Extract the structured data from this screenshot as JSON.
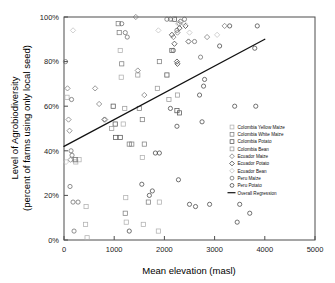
{
  "chart_data": {
    "type": "scatter",
    "title": "",
    "xlabel": "Mean elevation (masl)",
    "ylabel_line1": "Level of Agrobiodiversity",
    "ylabel_line2": "(percent of farms using only local seed)",
    "xlim": [
      0,
      5000
    ],
    "ylim": [
      0,
      100
    ],
    "xticks": [
      0,
      1000,
      2000,
      3000,
      4000,
      5000
    ],
    "xticklabels": [
      "0",
      "1000",
      "2000",
      "3000",
      "4000",
      "5000"
    ],
    "yticks": [
      0,
      20,
      40,
      60,
      80,
      100
    ],
    "yticklabels": [
      "0%",
      "20%",
      "40%",
      "60%",
      "80%",
      "100%"
    ],
    "grid": false,
    "legend_position": "right-middle",
    "regression": {
      "name": "Overall Regression",
      "x_start": 0,
      "y_start": 42,
      "x_end": 4000,
      "y_end": 90,
      "color": "#111111"
    },
    "series": [
      {
        "name": "Colombia Yellow Maize",
        "marker": "square",
        "color": "#b0b0b0",
        "points": [
          [
            60,
            64
          ],
          [
            210,
            36
          ],
          [
            235,
            35
          ],
          [
            300,
            36
          ],
          [
            430,
            7
          ],
          [
            460,
            1
          ],
          [
            440,
            15
          ],
          [
            1140,
            73
          ],
          [
            1120,
            85
          ],
          [
            1180,
            52
          ],
          [
            1230,
            19
          ],
          [
            1240,
            8
          ],
          [
            1560,
            37
          ],
          [
            1580,
            7
          ],
          [
            1880,
            4
          ],
          [
            1900,
            17
          ]
        ]
      },
      {
        "name": "Colombia White Maize",
        "marker": "square",
        "color": "#808080",
        "points": [
          [
            230,
            36
          ],
          [
            1100,
            93
          ],
          [
            1080,
            97
          ],
          [
            1150,
            79
          ],
          [
            1220,
            12
          ],
          [
            1300,
            43
          ],
          [
            1350,
            43
          ],
          [
            1500,
            59
          ],
          [
            1560,
            54
          ],
          [
            1600,
            43
          ],
          [
            1680,
            17
          ],
          [
            1900,
            80
          ]
        ]
      },
      {
        "name": "Colombia Potato",
        "marker": "square",
        "color": "#555555",
        "points": [
          [
            980,
            60
          ],
          [
            1020,
            52
          ],
          [
            1030,
            46
          ],
          [
            1120,
            46
          ],
          [
            2150,
            85
          ],
          [
            2200,
            99
          ],
          [
            2250,
            58
          ],
          [
            2300,
            57
          ],
          [
            2050,
            74
          ]
        ]
      },
      {
        "name": "Colombia Bean",
        "marker": "square",
        "color": "#9a9a9a",
        "points": [
          [
            950,
            50
          ],
          [
            1210,
            59
          ],
          [
            1470,
            74
          ],
          [
            1860,
            68
          ],
          [
            2090,
            63
          ],
          [
            2260,
            65
          ]
        ]
      },
      {
        "name": "Ecuador Maize",
        "marker": "diamond",
        "color": "#777777",
        "points": [
          [
            70,
            68
          ],
          [
            90,
            54
          ],
          [
            110,
            49
          ],
          [
            130,
            36
          ],
          [
            620,
            68
          ],
          [
            700,
            61
          ],
          [
            800,
            54
          ],
          [
            820,
            54
          ],
          [
            1430,
            100
          ],
          [
            1470,
            76
          ],
          [
            1600,
            65
          ],
          [
            2180,
            91
          ],
          [
            2260,
            93
          ],
          [
            2300,
            97
          ],
          [
            2850,
            91
          ],
          [
            3200,
            96
          ]
        ]
      },
      {
        "name": "Ecuador Potato",
        "marker": "diamond",
        "color": "#3a3a3a",
        "points": [
          [
            2150,
            92
          ],
          [
            2200,
            88
          ],
          [
            2250,
            80
          ],
          [
            2260,
            79
          ],
          [
            2300,
            95
          ],
          [
            2320,
            98
          ],
          [
            2420,
            96
          ],
          [
            2480,
            89
          ]
        ]
      },
      {
        "name": "Ecuador Bean",
        "marker": "diamond",
        "color": "#c0c0c0",
        "points": [
          [
            40,
            35
          ],
          [
            180,
            94
          ],
          [
            1880,
            94
          ],
          [
            2150,
            99
          ],
          [
            2270,
            97
          ],
          [
            2400,
            97
          ],
          [
            2500,
            93
          ],
          [
            3050,
            92
          ]
        ]
      },
      {
        "name": "Peru Maize",
        "marker": "circle",
        "color": "#6a6a6a",
        "points": [
          [
            30,
            80
          ],
          [
            150,
            63
          ],
          [
            120,
            24
          ],
          [
            140,
            40
          ],
          [
            160,
            38
          ],
          [
            180,
            17
          ],
          [
            200,
            4
          ],
          [
            280,
            17
          ],
          [
            1150,
            97
          ],
          [
            1220,
            93
          ],
          [
            1260,
            91
          ],
          [
            2050,
            99
          ],
          [
            2120,
            99
          ],
          [
            2180,
            85
          ],
          [
            2250,
            94
          ],
          [
            2400,
            99
          ],
          [
            2600,
            89
          ],
          [
            2720,
            82
          ]
        ]
      },
      {
        "name": "Peru Potato",
        "marker": "circle",
        "color": "#444444",
        "points": [
          [
            1300,
            4
          ],
          [
            1550,
            25
          ],
          [
            1700,
            20
          ],
          [
            1760,
            22
          ],
          [
            1820,
            39
          ],
          [
            1900,
            39
          ],
          [
            2120,
            59
          ],
          [
            2250,
            51
          ],
          [
            2280,
            27
          ],
          [
            2500,
            16
          ],
          [
            2620,
            15
          ],
          [
            2700,
            65
          ],
          [
            2750,
            53
          ],
          [
            2780,
            69
          ],
          [
            2800,
            72
          ],
          [
            2900,
            16
          ],
          [
            3100,
            87
          ],
          [
            3300,
            96
          ],
          [
            3400,
            60
          ],
          [
            3450,
            8
          ],
          [
            3500,
            16
          ],
          [
            3700,
            12
          ],
          [
            3820,
            60
          ],
          [
            3850,
            96
          ],
          [
            3800,
            86
          ]
        ]
      }
    ]
  }
}
